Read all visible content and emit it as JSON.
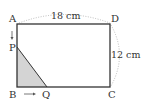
{
  "diagram": {
    "type": "geometry-rectangle",
    "vertices": {
      "A": {
        "label": "A"
      },
      "B": {
        "label": "B"
      },
      "C": {
        "label": "C"
      },
      "D": {
        "label": "D"
      },
      "P": {
        "label": "P"
      },
      "Q": {
        "label": "Q"
      }
    },
    "dimensions": {
      "width": "18 cm",
      "height": "12 cm"
    },
    "shaded_region": "triangle PBQ",
    "motion": {
      "P": "moves from A toward B",
      "Q": "moves from B toward C"
    },
    "colors": {
      "outline": "#333333",
      "shade": "#d4d4d4",
      "dotted": "#aaaaaa"
    }
  }
}
